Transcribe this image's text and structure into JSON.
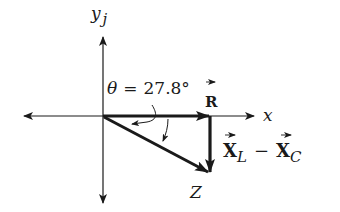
{
  "diagram": {
    "axes": {
      "x_label": "x",
      "y_label": "y",
      "y_unit_label": "j"
    },
    "angle": {
      "symbol": "θ",
      "equals": "=",
      "value": "27.8°",
      "degrees": 27.8
    },
    "vectors": {
      "resistance": {
        "label": "R",
        "has_vector_arrow": true
      },
      "reactance": {
        "left_label": "X",
        "left_subscript": "L",
        "operator": "−",
        "right_label": "X",
        "right_subscript": "C",
        "has_vector_arrow": true
      },
      "impedance": {
        "label": "Z"
      }
    },
    "colors": {
      "ink": "#1a1a1a",
      "background": "#ffffff"
    }
  }
}
